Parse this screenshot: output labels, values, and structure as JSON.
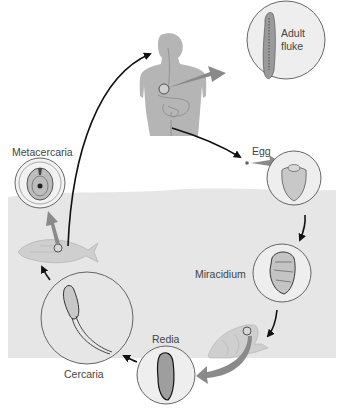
{
  "diagram": {
    "type": "life-cycle",
    "colors": {
      "background": "#ffffff",
      "water": "#e6e6e6",
      "human": "#b3b3b3",
      "host_fill": "#c8c8c8",
      "circle_fill": "#eeeeee",
      "circle_stroke": "#555555",
      "arrow_black": "#111111",
      "arrow_gray": "#8a8a8a",
      "label_text": "#444444"
    },
    "stages": [
      {
        "id": "adult_fluke",
        "label": "Adult fluke",
        "host": "human"
      },
      {
        "id": "egg",
        "label": "Egg"
      },
      {
        "id": "miracidium",
        "label": "Miracidium"
      },
      {
        "id": "redia",
        "label": "Redia",
        "host": "snail"
      },
      {
        "id": "cercaria",
        "label": "Cercaria"
      },
      {
        "id": "metacercaria",
        "label": "Metacercaria",
        "host": "fish"
      }
    ],
    "labels": {
      "adult_fluke": "Adult fluke",
      "egg": "Egg",
      "miracidium": "Miracidium",
      "redia": "Redia",
      "cercaria": "Cercaria",
      "metacercaria": "Metacercaria"
    },
    "hosts": [
      "human",
      "snail",
      "fish"
    ]
  }
}
